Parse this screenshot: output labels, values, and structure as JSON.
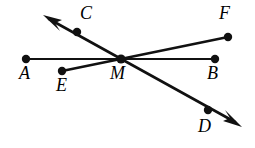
{
  "figure": {
    "type": "geometry-diagram",
    "canvas": {
      "width": 255,
      "height": 148,
      "background": "#ffffff"
    },
    "stroke_color": "#111111",
    "label_color": "#000000",
    "vertex": {
      "name": "M",
      "x": 121,
      "y": 59,
      "radius": 4.2
    },
    "points": [
      {
        "id": "A",
        "label": "A",
        "x": 26,
        "y": 59,
        "dot": true,
        "label_x": 19,
        "label_y": 64
      },
      {
        "id": "B",
        "label": "B",
        "x": 215,
        "y": 59,
        "dot": true,
        "label_x": 207,
        "label_y": 64
      },
      {
        "id": "C",
        "label": "C",
        "x": 77,
        "y": 32,
        "dot": true,
        "label_x": 80,
        "label_y": 4
      },
      {
        "id": "D",
        "label": "D",
        "x": 208,
        "y": 110,
        "dot": true,
        "label_x": 198,
        "label_y": 117
      },
      {
        "id": "E",
        "label": "E",
        "x": 62,
        "y": 71,
        "dot": true,
        "label_x": 56,
        "label_y": 76
      },
      {
        "id": "F",
        "label": "F",
        "x": 228,
        "y": 37,
        "dot": true,
        "label_x": 219,
        "label_y": 4
      },
      {
        "id": "M",
        "label": "M",
        "x": 121,
        "y": 59,
        "dot": true,
        "label_x": 110,
        "label_y": 64
      }
    ],
    "segments": [
      {
        "id": "AB",
        "from": "A",
        "to": "B",
        "x1": 26,
        "y1": 59,
        "x2": 215,
        "y2": 59,
        "width": 2.2,
        "arrow_start": false,
        "arrow_end": false
      },
      {
        "id": "EF",
        "from": "E",
        "to": "F",
        "x1": 62,
        "y1": 71,
        "x2": 228,
        "y2": 37,
        "width": 2.4,
        "arrow_start": false,
        "arrow_end": false
      },
      {
        "id": "CD",
        "from": "C",
        "to": "D",
        "x1": 47,
        "y1": 18,
        "x2": 237,
        "y2": 123,
        "width": 2.6,
        "arrow_start": true,
        "arrow_end": true
      }
    ],
    "arrows": [
      {
        "id": "arrow-up-left",
        "tip_x": 44,
        "tip_y": 16,
        "angle_deg": 209,
        "on_segment": "CD",
        "beyond": "C"
      },
      {
        "id": "arrow-down-right",
        "tip_x": 241,
        "tip_y": 126,
        "angle_deg": 29,
        "on_segment": "CD",
        "beyond": "D"
      }
    ],
    "dot_radius": 4.2
  }
}
